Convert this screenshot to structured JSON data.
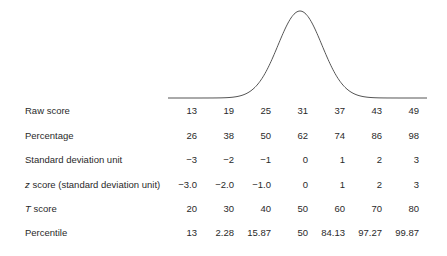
{
  "chart_data": {
    "type": "table",
    "curve": "normal-bell-curve",
    "columns": 7,
    "rows": [
      {
        "label_prefix": "",
        "label": "Raw score",
        "values": [
          "13",
          "19",
          "25",
          "31",
          "37",
          "43",
          "49"
        ]
      },
      {
        "label_prefix": "",
        "label": "Percentage",
        "values": [
          "26",
          "38",
          "50",
          "62",
          "74",
          "86",
          "98"
        ]
      },
      {
        "label_prefix": "",
        "label": "Standard deviation unit",
        "values": [
          "−3",
          "−2",
          "−1",
          "0",
          "1",
          "2",
          "3"
        ]
      },
      {
        "label_prefix": "z",
        "label": " score (standard deviation unit)",
        "values": [
          "−3.0",
          "−2.0",
          "−1.0",
          "0",
          "1",
          "2",
          "3"
        ]
      },
      {
        "label_prefix": "T",
        "label": " score",
        "values": [
          "20",
          "30",
          "40",
          "50",
          "60",
          "70",
          "80"
        ]
      },
      {
        "label_prefix": "",
        "label": "Percentile",
        "values": [
          "13",
          "2.28",
          "15.87",
          "50",
          "84.13",
          "97.27",
          "99.87"
        ]
      }
    ]
  },
  "colors": {
    "curve": "#555555",
    "text": "#2a2a2a",
    "background": "#ffffff"
  }
}
